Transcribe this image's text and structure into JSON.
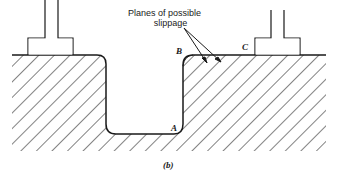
{
  "diagram": {
    "caption": "(b)",
    "annotation": {
      "line1": "Planes of possible",
      "line2": "slippage"
    },
    "points": {
      "A": "A",
      "B": "B",
      "C": "C"
    },
    "elements": [
      "left-footing",
      "right-footing",
      "ground-surface",
      "excavation-trench",
      "hatched-soil",
      "slippage-arrows"
    ],
    "colors": {
      "line": "#1a1a1a",
      "background": "#ffffff"
    }
  }
}
